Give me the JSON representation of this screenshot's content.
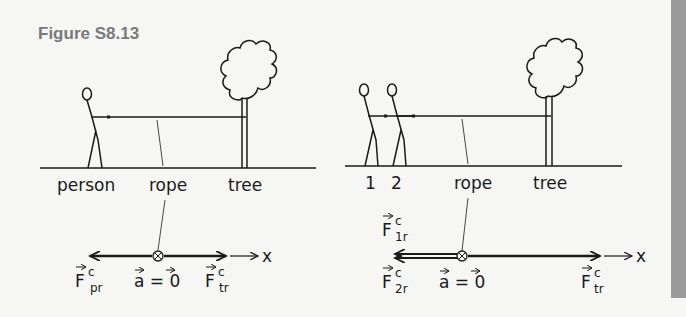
{
  "figure": {
    "title": "Figure S8.13"
  },
  "panel_left": {
    "labels": {
      "person": "person",
      "rope": "rope",
      "tree": "tree"
    },
    "vectors": {
      "left_force": "F",
      "left_force_sup": "c",
      "left_force_sub": "pr",
      "accel": "a = 0",
      "right_force": "F",
      "right_force_sup": "c",
      "right_force_sub": "tr",
      "axis": "x"
    }
  },
  "panel_right": {
    "labels": {
      "person1": "1",
      "person2": "2",
      "rope": "rope",
      "tree": "tree"
    },
    "vectors": {
      "top_force": "F",
      "top_force_sup": "c",
      "top_force_sub": "1r",
      "bottom_force": "F",
      "bottom_force_sup": "c",
      "bottom_force_sub": "2r",
      "accel": "a = 0",
      "right_force": "F",
      "right_force_sup": "c",
      "right_force_sub": "tr",
      "axis": "x"
    }
  },
  "colors": {
    "background": "#f6f6f4",
    "ink": "#1a1a1a",
    "title": "#7a7a7a",
    "side_bar": "#9a9a9a"
  }
}
